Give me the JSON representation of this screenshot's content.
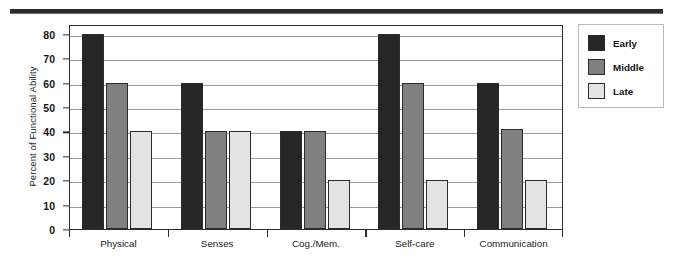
{
  "chart_data": {
    "type": "bar",
    "title": "",
    "xlabel": "",
    "ylabel": "Percent of Functional Ability",
    "categories": [
      "Physical",
      "Senses",
      "Cog./Mem.",
      "Self-care",
      "Communication"
    ],
    "series": [
      {
        "name": "Early",
        "color": "#262626",
        "values": [
          80,
          60,
          40,
          80,
          60
        ]
      },
      {
        "name": "Middle",
        "color": "#808080",
        "values": [
          60,
          40,
          40,
          60,
          41
        ]
      },
      {
        "name": "Late",
        "color": "#e3e3e3",
        "values": [
          40,
          40,
          20,
          20,
          20
        ]
      }
    ],
    "ylim": [
      0,
      84
    ],
    "yticks": [
      0,
      10,
      20,
      30,
      40,
      50,
      60,
      70,
      80
    ],
    "ytick_labels": [
      "0",
      "10",
      "20",
      "30",
      "40",
      "50",
      "60",
      "70",
      "80"
    ],
    "grid": true,
    "grid_axis": "y",
    "legend_position": "right",
    "frame_color": "#2b2b2b",
    "gridline_color": "#9a9a9a",
    "bar_edge_color": "#2b2b2b",
    "background_color": "#ffffff"
  },
  "decoration": {
    "top_rule_color": "#2b2b2b"
  },
  "legend": {
    "entries": [
      {
        "label": "Early",
        "color": "#262626"
      },
      {
        "label": "Middle",
        "color": "#808080"
      },
      {
        "label": "Late",
        "color": "#e3e3e3"
      }
    ]
  }
}
